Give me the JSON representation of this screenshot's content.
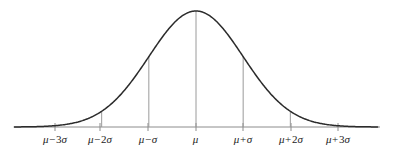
{
  "chart_data": {
    "type": "line",
    "title": "",
    "subtitle": "",
    "xlabel": "",
    "ylabel": "",
    "grid": false,
    "legend": "none",
    "curve_name": "normal-distribution-bell-curve",
    "distribution": "normal",
    "mean": 0,
    "sd": 1,
    "xlim": [
      -3.85,
      3.85
    ],
    "ylim": [
      0,
      1
    ],
    "x": [
      -3.85,
      -3.5,
      -3,
      -2.5,
      -2,
      -1.5,
      -1,
      -0.5,
      0,
      0.5,
      1,
      1.5,
      2,
      2.5,
      3,
      3.5,
      3.85
    ],
    "values": [
      0.0006,
      0.0022,
      0.0111,
      0.0439,
      0.1353,
      0.3247,
      0.6065,
      0.8825,
      1.0,
      0.8825,
      0.6065,
      0.3247,
      0.1353,
      0.0439,
      0.0111,
      0.0022,
      0.0006
    ],
    "tick_values": [
      -3,
      -2,
      -1,
      0,
      1,
      2,
      3
    ],
    "tick_labels": [
      "μ − 3σ",
      "μ − 2σ",
      "μ − σ",
      "μ",
      "μ + σ",
      "μ + 2σ",
      "μ + 3σ"
    ],
    "dropline_values": [
      -2,
      -1,
      0,
      1,
      2
    ],
    "dropline_heights": [
      0.1353,
      0.6065,
      1.0,
      0.6065,
      0.1353
    ],
    "colors": {
      "curve": "#2b2b2b",
      "axis": "#8c8c8c",
      "dropline": "#9a9a9a",
      "tick": "#8c8c8c",
      "label": "#1c1c1c",
      "background": "#ffffff"
    }
  },
  "axis": {
    "name": "horizontal-axis",
    "y_px": 127,
    "x_start_px": 14,
    "x_end_px": 380
  },
  "ticks": [
    {
      "id": "tick-mu-minus-3sigma",
      "x_px": 55,
      "mu": "μ",
      "op": "−",
      "num": "3",
      "sigma": "σ",
      "text": "μ − 3σ"
    },
    {
      "id": "tick-mu-minus-2sigma",
      "x_px": 100,
      "mu": "μ",
      "op": "−",
      "num": "2",
      "sigma": "σ",
      "text": "μ − 2σ"
    },
    {
      "id": "tick-mu-minus-sigma",
      "x_px": 148,
      "mu": "μ",
      "op": "−",
      "num": "",
      "sigma": "σ",
      "text": "μ − σ"
    },
    {
      "id": "tick-mu",
      "x_px": 196,
      "mu": "μ",
      "op": "",
      "num": "",
      "sigma": "",
      "text": "μ"
    },
    {
      "id": "tick-mu-plus-sigma",
      "x_px": 243,
      "mu": "μ",
      "op": "+",
      "num": "",
      "sigma": "σ",
      "text": "μ + σ"
    },
    {
      "id": "tick-mu-plus-2sigma",
      "x_px": 291,
      "mu": "μ",
      "op": "+",
      "num": "2",
      "sigma": "σ",
      "text": "μ + 2σ"
    },
    {
      "id": "tick-mu-plus-3sigma",
      "x_px": 338,
      "mu": "μ",
      "op": "+",
      "num": "3",
      "sigma": "σ",
      "text": "μ + 3σ"
    }
  ]
}
